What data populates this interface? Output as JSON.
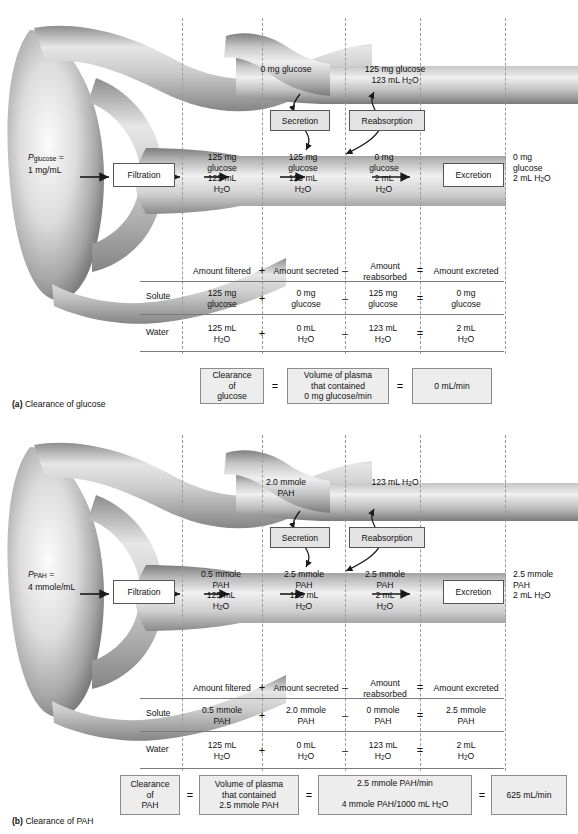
{
  "figure": {
    "domain": "physiology-diagram"
  },
  "panels": [
    {
      "id": "a",
      "caption_label": "(a)",
      "caption_text": "Clearance of glucose",
      "plasma": {
        "symbol": "P",
        "subscript": "glucose",
        "equals": "=",
        "value": "1 mg/mL"
      },
      "process_boxes": {
        "filtration": "Filtration",
        "secretion": "Secretion",
        "reabsorption": "Reabsorption",
        "excretion": "Excretion"
      },
      "vessel_labels": {
        "secreted_into_blood": "0 mg glucose",
        "reabsorbed_into_blood_solute": "125 mg glucose",
        "reabsorbed_into_blood_water": "123 mL H2O"
      },
      "tubule_stages": [
        {
          "name": "filtered",
          "solute": "125 mg",
          "solute_unit": "glucose",
          "water": "125 mL",
          "water_unit": "H2O"
        },
        {
          "name": "after-secretion",
          "solute": "125 mg",
          "solute_unit": "glucose",
          "water": "125 mL",
          "water_unit": "H2O"
        },
        {
          "name": "after-reabsorption",
          "solute": "0 mg",
          "solute_unit": "glucose",
          "water": "2 mL",
          "water_unit": "H2O"
        }
      ],
      "excreted": {
        "solute": "0 mg",
        "solute_unit": "glucose",
        "water": "2 mL H2O"
      },
      "table": {
        "headers": [
          "Amount filtered",
          "Amount secreted",
          "Amount reabsorbed",
          "Amount excreted"
        ],
        "header_reabsorbed_line1": "Amount",
        "header_reabsorbed_line2": "reabsorbed",
        "operators": [
          "+",
          "–",
          "="
        ],
        "rows": [
          {
            "label": "Solute",
            "cells": [
              {
                "line1": "125 mg",
                "line2": "glucose"
              },
              {
                "line1": "0 mg",
                "line2": "glucose"
              },
              {
                "line1": "125 mg",
                "line2": "glucose"
              },
              {
                "line1": "0 mg",
                "line2": "glucose"
              }
            ]
          },
          {
            "label": "Water",
            "cells": [
              {
                "line1": "125 mL",
                "line2": "H2O"
              },
              {
                "line1": "0 mL",
                "line2": "H2O"
              },
              {
                "line1": "123 mL",
                "line2": "H2O"
              },
              {
                "line1": "2 mL",
                "line2": "H2O"
              }
            ]
          }
        ]
      },
      "equation": {
        "box1_line1": "Clearance",
        "box1_line2": "of",
        "box1_line3": "glucose",
        "eq1": "=",
        "box2_line1": "Volume of plasma",
        "box2_line2": "that contained",
        "box2_line3": "0 mg glucose/min",
        "eq2": "=",
        "box3": "0 mL/min"
      }
    },
    {
      "id": "b",
      "caption_label": "(b)",
      "caption_text": "Clearance of PAH",
      "plasma": {
        "symbol": "P",
        "subscript": "PAH",
        "equals": "=",
        "value": "4 mmole/mL"
      },
      "process_boxes": {
        "filtration": "Filtration",
        "secretion": "Secretion",
        "reabsorption": "Reabsorption",
        "excretion": "Excretion"
      },
      "vessel_labels": {
        "secreted_into_blood_line1": "2.0 mmole",
        "secreted_into_blood_line2": "PAH",
        "reabsorbed_into_blood_water": "123 mL H2O"
      },
      "tubule_stages": [
        {
          "name": "filtered",
          "solute": "0.5 mmole",
          "solute_unit": "PAH",
          "water": "125 mL",
          "water_unit": "H2O"
        },
        {
          "name": "after-secretion",
          "solute": "2.5 mmole",
          "solute_unit": "PAH",
          "water": "125 mL",
          "water_unit": "H2O"
        },
        {
          "name": "after-reabsorption",
          "solute": "2.5 mmole",
          "solute_unit": "PAH",
          "water": "2 mL",
          "water_unit": "H2O"
        }
      ],
      "excreted": {
        "solute": "2.5 mmole",
        "solute_unit": "PAH",
        "water": "2 mL H2O"
      },
      "table": {
        "headers": [
          "Amount filtered",
          "Amount secreted",
          "Amount reabsorbed",
          "Amount excreted"
        ],
        "header_reabsorbed_line1": "Amount",
        "header_reabsorbed_line2": "reabsorbed",
        "operators": [
          "+",
          "–",
          "="
        ],
        "rows": [
          {
            "label": "Solute",
            "cells": [
              {
                "line1": "0.5 mmole",
                "line2": "PAH"
              },
              {
                "line1": "2.0 mmole",
                "line2": "PAH"
              },
              {
                "line1": "0 mmole",
                "line2": "PAH"
              },
              {
                "line1": "2.5 mmole",
                "line2": "PAH"
              }
            ]
          },
          {
            "label": "Water",
            "cells": [
              {
                "line1": "125 mL",
                "line2": "H2O"
              },
              {
                "line1": "0 mL",
                "line2": "H2O"
              },
              {
                "line1": "123 mL",
                "line2": "H2O"
              },
              {
                "line1": "2 mL",
                "line2": "H2O"
              }
            ]
          }
        ]
      },
      "equation": {
        "box1_line1": "Clearance",
        "box1_line2": "of",
        "box1_line3": "PAH",
        "eq1": "=",
        "box2_line1": "Volume of plasma",
        "box2_line2": "that contained",
        "box2_line3": "2.5 mmole PAH",
        "eq2": "=",
        "box3_line1": "2.5 mmole PAH/min",
        "box3_line2": "4 mmole PAH/1000 mL H2O",
        "eq3": "=",
        "box4": "625 mL/min"
      }
    }
  ],
  "colors": {
    "tubule_light": "#f2f2f2",
    "tubule_mid": "#b9b9b9",
    "tubule_dark": "#6f6f6f",
    "box_fill": "#e3e3e3",
    "eq_box_fill": "#ededed",
    "rule": "#7a7a7a",
    "dashed_guide": "#9a9a9a",
    "text": "#101010"
  }
}
